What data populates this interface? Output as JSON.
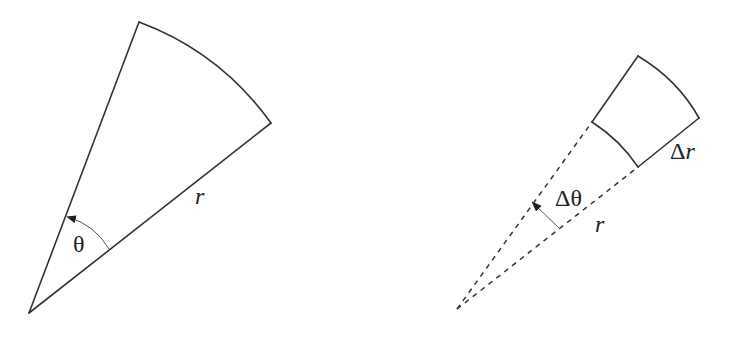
{
  "left_figure": {
    "description": "Circular sector with radius r and angle theta",
    "labels": {
      "radius": "r",
      "angle": "θ"
    }
  },
  "right_figure": {
    "description": "Polar area element between r and r+Δr, angle Δθ",
    "labels": {
      "radius": "r",
      "delta_angle": "Δθ",
      "delta_radius": "Δr"
    }
  },
  "colors": {
    "stroke": "#333333",
    "background": "#ffffff"
  }
}
